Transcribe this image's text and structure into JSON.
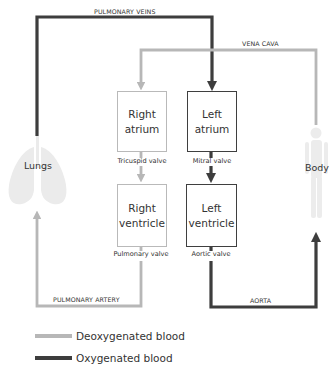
{
  "colors": {
    "deoxygenated": "#b7b7b7",
    "oxygenated": "#3d3d3d",
    "organ_fill": "#e9e9e9"
  },
  "vessels": {
    "pulmonary_veins": "PULMONARY VEINS",
    "vena_cava": "VENA CAVA",
    "pulmonary_artery": "PULMONARY ARTERY",
    "aorta": "AORTA"
  },
  "chambers": {
    "right_atrium": {
      "line1": "Right",
      "line2": "atrium",
      "blood": "deoxygenated"
    },
    "left_atrium": {
      "line1": "Left",
      "line2": "atrium",
      "blood": "oxygenated"
    },
    "right_ventricle": {
      "line1": "Right",
      "line2": "ventricle",
      "blood": "deoxygenated"
    },
    "left_ventricle": {
      "line1": "Left",
      "line2": "ventricle",
      "blood": "oxygenated"
    }
  },
  "valves": {
    "tricuspid": "Tricuspid valve",
    "mitral": "Mitral valve",
    "pulmonary": "Pulmonary valve",
    "aortic": "Aortic valve"
  },
  "organs": {
    "lungs": "Lungs",
    "body": "Body"
  },
  "legend": [
    {
      "label": "Deoxygenated blood",
      "color": "#b7b7b7"
    },
    {
      "label": "Oxygenated blood",
      "color": "#3d3d3d"
    }
  ]
}
